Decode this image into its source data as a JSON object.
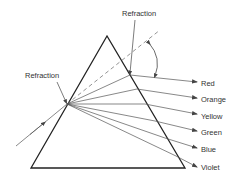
{
  "diagram": {
    "labels": {
      "refraction_top": "Refraction",
      "refraction_left": "Refraction"
    },
    "colors_out": [
      {
        "name": "Red",
        "label": "Red"
      },
      {
        "name": "Orange",
        "label": "Orange"
      },
      {
        "name": "Yellow",
        "label": "Yellow"
      },
      {
        "name": "Green",
        "label": "Green"
      },
      {
        "name": "Blue",
        "label": "Blue"
      },
      {
        "name": "Violet",
        "label": "Violet"
      }
    ],
    "stroke_color": "#222222",
    "ray_color": "#555555"
  }
}
